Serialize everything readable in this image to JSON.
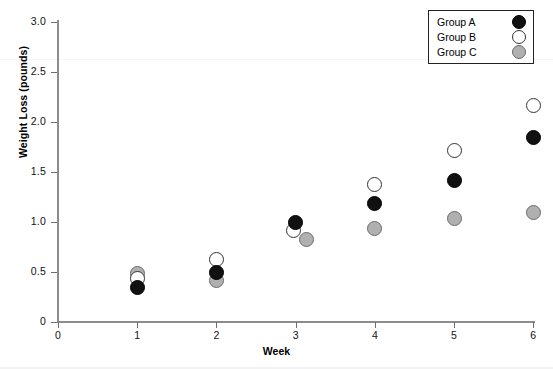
{
  "chart_data": {
    "type": "scatter",
    "title": "",
    "xlabel": "Week",
    "ylabel": "Weight Loss (pounds)",
    "x": [
      1,
      2,
      3,
      4,
      5,
      6
    ],
    "categories": [
      "1",
      "2",
      "3",
      "4",
      "5",
      "6"
    ],
    "xlim": [
      0,
      6
    ],
    "ylim": [
      0,
      3.0
    ],
    "xticks": [
      "0",
      "1",
      "2",
      "3",
      "4",
      "5",
      "6"
    ],
    "yticks": [
      "0",
      "0.5",
      "1.0",
      "1.5",
      "2.0",
      "2.5",
      "3.0"
    ],
    "ytick_values": [
      0,
      0.5,
      1.0,
      1.5,
      2.0,
      2.5,
      3.0
    ],
    "xtick_values": [
      0,
      1,
      2,
      3,
      4,
      5,
      6
    ],
    "grid": false,
    "legend_position": "top-right",
    "series": [
      {
        "name": "Group A",
        "marker": "filled-circle",
        "color": "#111111",
        "edge_color": "#000000",
        "x": [
          1,
          2,
          3,
          4,
          5,
          6
        ],
        "values": [
          0.35,
          0.5,
          1.0,
          1.19,
          1.42,
          1.85
        ]
      },
      {
        "name": "Group B",
        "marker": "open-circle",
        "color": "#ffffff",
        "edge_color": "#333333",
        "x": [
          1,
          2,
          3,
          4,
          5,
          6
        ],
        "values": [
          0.44,
          0.63,
          0.92,
          1.38,
          1.72,
          2.17
        ]
      },
      {
        "name": "Group C",
        "marker": "gray-circle",
        "color": "#b0b0b0",
        "edge_color": "#6b6b6b",
        "x": [
          1,
          2,
          3,
          4,
          5,
          6
        ],
        "values": [
          0.49,
          0.42,
          0.83,
          0.94,
          1.04,
          1.1
        ]
      }
    ]
  },
  "legend": {
    "entries": [
      {
        "label": "Group A",
        "swatch": "filled-circle-black"
      },
      {
        "label": "Group B",
        "swatch": "open-circle-white"
      },
      {
        "label": "Group C",
        "swatch": "filled-circle-gray"
      }
    ]
  }
}
